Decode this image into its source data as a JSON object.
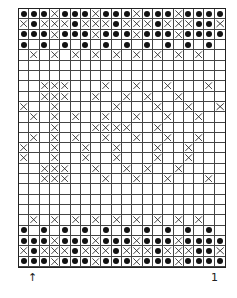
{
  "chart": {
    "cols": 20,
    "rows": 25,
    "legend": {
      "dot": "purl-dot",
      "x": "cross-stitch",
      "empty": "knit"
    },
    "grid": [
      "●●●X●●●X●●●X●●●X●●●●",
      "X●XXX●XXX●XXX●XXX●●X",
      "●●●X●●●X●●●X●●●X●●●●",
      "●.●.●.●.●.●.●.●.●.●.",
      ".X.X.X.X.X.X.X.X.X..",
      "....................",
      "....................",
      "..XXX...X..X..X...X.",
      "..XXX..X..X.X..X....",
      "X..X.....X...X..X..X",
      ".X.X.X..X..X..X..X..",
      "...X...XXXX..X......",
      ".X.X.X..X..X..X..X..",
      "X..X..X..X...X..X...",
      "X..X..X..X...X..X...",
      "..XXX..X..X.X..X....",
      "..XXX...X..X..X...X.",
      "....................",
      "....................",
      "....................",
      ".X.X.X.X.X.X.X.X.X..",
      "●.●.●.●.●.●.●.●.●.●.",
      "●●●X●●●X●●●X●●●X●●●●",
      "X●XXX●XXX●XXX●XXX●●X",
      "●●●X●●●X●●●X●●●X●●●●"
    ]
  },
  "labels": {
    "left": "↑",
    "right": "1"
  }
}
